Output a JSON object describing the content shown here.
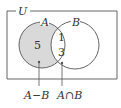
{
  "diagram": {
    "type": "venn",
    "universe_label": "U",
    "sets": [
      {
        "name": "A",
        "label": "A"
      },
      {
        "name": "B",
        "label": "B"
      }
    ],
    "regions": {
      "a_only": {
        "value": "5",
        "shaded": true
      },
      "intersection": {
        "values": [
          "1",
          "3"
        ],
        "shaded": false
      }
    },
    "callouts": [
      {
        "target": "a_only",
        "label": "A−B"
      },
      {
        "target": "intersection",
        "label": "A∩B"
      }
    ],
    "colors": {
      "shade": "#d9d9d9",
      "stroke": "#555555",
      "text": "#333333"
    }
  }
}
